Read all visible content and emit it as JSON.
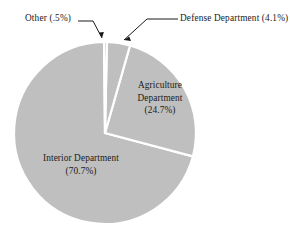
{
  "chart_data": {
    "type": "pie",
    "title": "",
    "subtitle": "",
    "xlabel": "",
    "ylabel": "",
    "grid": false,
    "legend_position": "none",
    "label_style": "direct-labels-with-leader-lines",
    "total_percent": 100.0,
    "categories": [
      "Interior Department",
      "Agriculture Department",
      "Defense Department",
      "Other"
    ],
    "values": [
      70.7,
      24.7,
      4.1,
      0.5
    ],
    "value_unit": "percent",
    "slice_colors": [
      "#bfbfbf",
      "#bfbfbf",
      "#bfbfbf",
      "#bfbfbf"
    ],
    "separator_color": "#ffffff",
    "slices": [
      {
        "name": "Interior Department",
        "value": 70.7,
        "value_text": "(70.7%)",
        "label_lines": [
          "Interior Department",
          "(70.7%)"
        ],
        "label_placement": "inside",
        "leader_line": false
      },
      {
        "name": "Agriculture Department",
        "value": 24.7,
        "value_text": "(24.7%)",
        "label_lines": [
          "Agriculture",
          "Department",
          "(24.7%)"
        ],
        "label_placement": "inside",
        "leader_line": false
      },
      {
        "name": "Defense Department",
        "value": 4.1,
        "value_text": "(4.1%)",
        "label_lines": [
          "Defense Department (4.1%)"
        ],
        "label_placement": "outside",
        "leader_line": true
      },
      {
        "name": "Other",
        "value": 0.5,
        "value_text": "(.5%)",
        "label_lines": [
          "Other (.5%)"
        ],
        "label_placement": "outside",
        "leader_line": true
      }
    ]
  },
  "labels": {
    "other": "Other (.5%)",
    "defense": "Defense Department (4.1%)",
    "agriculture_line1": "Agriculture",
    "agriculture_line2": "Department",
    "agriculture_line3": "(24.7%)",
    "interior_line1": "Interior Department",
    "interior_line2": "(70.7%)"
  },
  "colors": {
    "background": "#ffffff",
    "slice_fill": "#bfbfbf",
    "slice_edge": "#ffffff",
    "text": "#1a1a1a",
    "leader_line": "#1a1a1a"
  }
}
